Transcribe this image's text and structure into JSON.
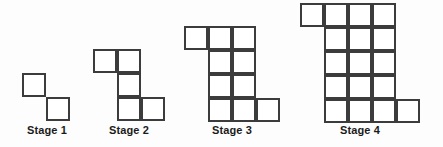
{
  "figure": {
    "background_color": "#fdfdfd",
    "line_color": "#3c3c3c",
    "cell_fill_color": "#ffffff",
    "label_color": "#1b1b1b",
    "cell_size_px": 24,
    "stroke_width_px": 2
  },
  "chart_data": {
    "type": "diagram",
    "title": "",
    "cell_size_px": 24,
    "stages": [
      {
        "id": "stage-1",
        "label": "Stage 1",
        "square_count": 2,
        "origin_x": 22,
        "origin_y": 73,
        "cols": 2,
        "rows": 2,
        "label_x": 22,
        "label_y": 124,
        "label_width": 50,
        "cells": [
          {
            "col": 0,
            "row": 0
          },
          {
            "col": 1,
            "row": 1
          }
        ]
      },
      {
        "id": "stage-2",
        "label": "Stage 2",
        "square_count": 5,
        "origin_x": 93,
        "origin_y": 49,
        "cols": 3,
        "rows": 3,
        "label_x": 93,
        "label_y": 124,
        "label_width": 72,
        "cells": [
          {
            "col": 0,
            "row": 0
          },
          {
            "col": 1,
            "row": 0
          },
          {
            "col": 1,
            "row": 1
          },
          {
            "col": 1,
            "row": 2
          },
          {
            "col": 2,
            "row": 2
          }
        ]
      },
      {
        "id": "stage-3",
        "label": "Stage 3",
        "square_count": 10,
        "origin_x": 184,
        "origin_y": 26,
        "cols": 4,
        "rows": 4,
        "label_x": 184,
        "label_y": 124,
        "label_width": 96,
        "cells": [
          {
            "col": 0,
            "row": 0
          },
          {
            "col": 1,
            "row": 0
          },
          {
            "col": 2,
            "row": 0
          },
          {
            "col": 1,
            "row": 1
          },
          {
            "col": 2,
            "row": 1
          },
          {
            "col": 1,
            "row": 2
          },
          {
            "col": 2,
            "row": 2
          },
          {
            "col": 1,
            "row": 3
          },
          {
            "col": 2,
            "row": 3
          },
          {
            "col": 3,
            "row": 3
          }
        ]
      },
      {
        "id": "stage-4",
        "label": "Stage 4",
        "square_count": 17,
        "origin_x": 300,
        "origin_y": 3,
        "cols": 5,
        "rows": 5,
        "label_x": 300,
        "label_y": 124,
        "label_width": 120,
        "cells": [
          {
            "col": 0,
            "row": 0
          },
          {
            "col": 1,
            "row": 0
          },
          {
            "col": 2,
            "row": 0
          },
          {
            "col": 3,
            "row": 0
          },
          {
            "col": 1,
            "row": 1
          },
          {
            "col": 2,
            "row": 1
          },
          {
            "col": 3,
            "row": 1
          },
          {
            "col": 1,
            "row": 2
          },
          {
            "col": 2,
            "row": 2
          },
          {
            "col": 3,
            "row": 2
          },
          {
            "col": 1,
            "row": 3
          },
          {
            "col": 2,
            "row": 3
          },
          {
            "col": 3,
            "row": 3
          },
          {
            "col": 1,
            "row": 4
          },
          {
            "col": 2,
            "row": 4
          },
          {
            "col": 3,
            "row": 4
          },
          {
            "col": 4,
            "row": 4
          }
        ]
      }
    ]
  }
}
